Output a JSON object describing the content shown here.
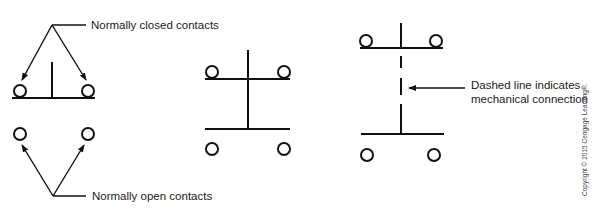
{
  "diagram": {
    "labels": {
      "normally_closed": "Normally closed contacts",
      "normally_open": "Normally open contacts",
      "dashed_line_1": "Dashed line indicates",
      "dashed_line_2": "mechanical connection"
    },
    "copyright": "Copyright © 2015 Cengage Learning®.",
    "symbols": [
      {
        "name": "single-pushbutton-contacts",
        "type": "normally closed and normally open contacts"
      },
      {
        "name": "double-acting-pushbutton",
        "type": "combined NC/NO with solid connection"
      },
      {
        "name": "mechanically-connected-pushbutton",
        "type": "NC/NO with dashed mechanical connection"
      }
    ],
    "colors": {
      "line": "#111111",
      "text": "#1a1a1a",
      "background": "#ffffff"
    }
  }
}
